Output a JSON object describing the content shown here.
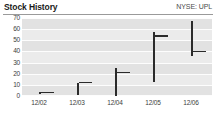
{
  "header": {
    "title": "Stock History",
    "ticker": "NYSE: UPL"
  },
  "chart_data": {
    "type": "bar",
    "title": "Stock History",
    "subtitle": "NYSE: UPL",
    "xlabel": "",
    "ylabel": "",
    "grid": true,
    "legend": false,
    "categories": [
      "12/02",
      "12/03",
      "12/04",
      "12/05",
      "12/06"
    ],
    "ylim": [
      0,
      70
    ],
    "yticks": [
      0,
      10,
      20,
      30,
      40,
      50,
      60,
      70
    ],
    "yticklabels": [
      "0",
      "10",
      "20",
      "30",
      "40",
      "50",
      "60",
      "70"
    ],
    "series": [
      {
        "name": "Price range (low-high, close tick)",
        "color": "#2b2b2b",
        "points": [
          {
            "x": "12/02",
            "low": 2,
            "high": 4,
            "close": 3
          },
          {
            "x": "12/03",
            "low": 1,
            "high": 12,
            "close": 12
          },
          {
            "x": "12/04",
            "low": 0,
            "high": 25,
            "close": 21
          },
          {
            "x": "12/05",
            "low": 13,
            "high": 57,
            "close": 54
          },
          {
            "x": "12/06",
            "low": 36,
            "high": 67,
            "close": 40
          }
        ]
      }
    ]
  }
}
